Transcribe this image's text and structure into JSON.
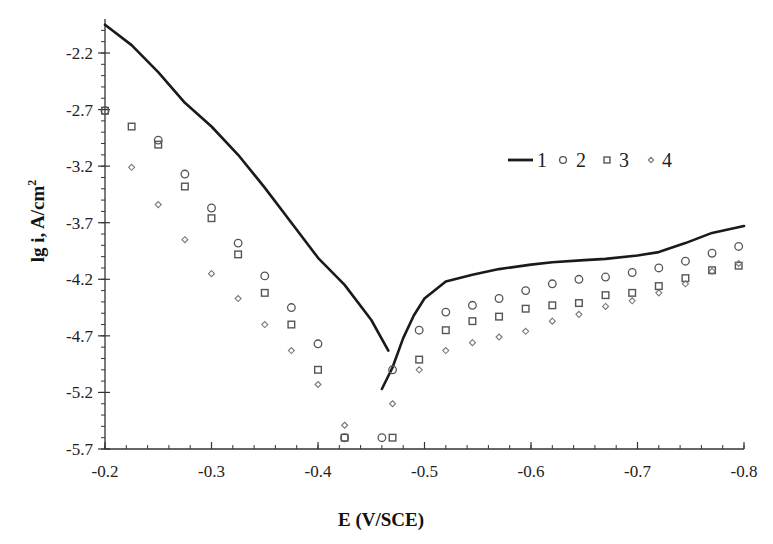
{
  "chart_data": {
    "type": "scatter",
    "title": "",
    "xlabel": "E (V/SCE)",
    "ylabel": "lg i, A/cm²",
    "xlim": [
      -0.2,
      -0.8
    ],
    "ylim": [
      -5.7,
      -1.95
    ],
    "x_ticks": [
      -0.2,
      -0.3,
      -0.4,
      -0.5,
      -0.6,
      -0.7,
      -0.8
    ],
    "x_tick_labels": [
      "-0.2",
      "-0.3",
      "-0.4",
      "-0.5",
      "-0.6",
      "-0.7",
      "-0.8"
    ],
    "y_ticks": [
      -2.2,
      -2.7,
      -3.2,
      -3.7,
      -4.2,
      -4.7,
      -5.2,
      -5.7
    ],
    "y_tick_labels": [
      "-2.2",
      "-2.7",
      "-3.2",
      "-3.7",
      "-4.2",
      "-4.7",
      "-5.2",
      "-5.7"
    ],
    "grid": false,
    "legend_position": "upper right (inside plot)",
    "series": [
      {
        "name": "1",
        "marker": "line",
        "color": "#1a1a1a",
        "segments": [
          {
            "x": [
              -0.2,
              -0.225,
              -0.25,
              -0.275,
              -0.3,
              -0.325,
              -0.35,
              -0.375,
              -0.4,
              -0.425,
              -0.45,
              -0.466
            ],
            "y": [
              -1.95,
              -2.13,
              -2.37,
              -2.64,
              -2.85,
              -3.1,
              -3.39,
              -3.7,
              -4.01,
              -4.25,
              -4.56,
              -4.83
            ]
          },
          {
            "x": [
              -0.46,
              -0.47,
              -0.48,
              -0.49,
              -0.5,
              -0.52,
              -0.545,
              -0.57,
              -0.6,
              -0.62,
              -0.65,
              -0.67,
              -0.7,
              -0.72,
              -0.745,
              -0.77,
              -0.8
            ],
            "y": [
              -5.17,
              -4.98,
              -4.72,
              -4.52,
              -4.37,
              -4.22,
              -4.16,
              -4.11,
              -4.07,
              -4.05,
              -4.03,
              -4.02,
              -3.99,
              -3.96,
              -3.88,
              -3.79,
              -3.73
            ]
          }
        ]
      },
      {
        "name": "2",
        "marker": "circle",
        "color": "#555555",
        "x": [
          -0.2,
          -0.25,
          -0.275,
          -0.3,
          -0.325,
          -0.35,
          -0.375,
          -0.4,
          -0.425,
          -0.46,
          -0.47,
          -0.495,
          -0.52,
          -0.545,
          -0.57,
          -0.595,
          -0.62,
          -0.645,
          -0.67,
          -0.695,
          -0.72,
          -0.745,
          -0.77,
          -0.795
        ],
        "y": [
          -2.71,
          -2.97,
          -3.27,
          -3.57,
          -3.88,
          -4.17,
          -4.45,
          -4.77,
          -5.6,
          -5.6,
          -5.0,
          -4.65,
          -4.49,
          -4.43,
          -4.37,
          -4.3,
          -4.24,
          -4.2,
          -4.18,
          -4.14,
          -4.1,
          -4.04,
          -3.97,
          -3.91
        ]
      },
      {
        "name": "3",
        "marker": "square",
        "color": "#555555",
        "x": [
          -0.2,
          -0.225,
          -0.25,
          -0.275,
          -0.3,
          -0.325,
          -0.35,
          -0.375,
          -0.4,
          -0.425,
          -0.47,
          -0.495,
          -0.52,
          -0.545,
          -0.57,
          -0.595,
          -0.62,
          -0.645,
          -0.67,
          -0.695,
          -0.72,
          -0.745,
          -0.77,
          -0.795
        ],
        "y": [
          -2.71,
          -2.85,
          -3.01,
          -3.38,
          -3.66,
          -3.98,
          -4.32,
          -4.6,
          -5.0,
          -5.6,
          -5.6,
          -4.91,
          -4.65,
          -4.57,
          -4.53,
          -4.46,
          -4.43,
          -4.41,
          -4.34,
          -4.32,
          -4.26,
          -4.19,
          -4.12,
          -4.08
        ]
      },
      {
        "name": "4",
        "marker": "diamond",
        "color": "#777777",
        "x": [
          -0.225,
          -0.25,
          -0.275,
          -0.3,
          -0.325,
          -0.35,
          -0.375,
          -0.4,
          -0.425,
          -0.47,
          -0.495,
          -0.52,
          -0.545,
          -0.57,
          -0.595,
          -0.62,
          -0.645,
          -0.67,
          -0.695,
          -0.72,
          -0.745,
          -0.77,
          -0.795
        ],
        "y": [
          -3.21,
          -3.54,
          -3.85,
          -4.15,
          -4.37,
          -4.6,
          -4.83,
          -5.13,
          -5.49,
          -5.3,
          -5.0,
          -4.83,
          -4.76,
          -4.71,
          -4.66,
          -4.57,
          -4.51,
          -4.44,
          -4.39,
          -4.32,
          -4.24,
          -4.13,
          -4.06
        ]
      }
    ]
  },
  "labels": {
    "xlabel": "E (V/SCE)",
    "ylabel_main": "lg i, A/cm",
    "ylabel_sup": "2",
    "legend": [
      "1",
      "2",
      "3",
      "4"
    ]
  }
}
